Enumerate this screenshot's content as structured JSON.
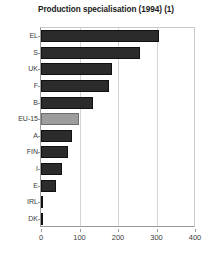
{
  "chart_data": {
    "type": "bar",
    "orientation": "horizontal",
    "title": "Production specialisation (1994) (1)",
    "xlabel": "",
    "ylabel": "",
    "categories": [
      "EL",
      "S",
      "UK",
      "F",
      "B",
      "EU-15",
      "A",
      "FIN",
      "I",
      "E",
      "IRL",
      "DK"
    ],
    "values": [
      307,
      256,
      184,
      177,
      134,
      98,
      80,
      70,
      55,
      39,
      3,
      2
    ],
    "xlim": [
      0,
      400
    ],
    "xticks": [
      0,
      100,
      200,
      300,
      400
    ],
    "xtick_labels": [
      "0",
      "100",
      "200",
      "300",
      "400"
    ],
    "grid": "vertical",
    "legend": "none",
    "highlight_category": "EU-15",
    "colors": {
      "bar": "#2b2b2b",
      "bar_highlight": "#9d9d9d",
      "grid": "#d5d5d5",
      "axis": "#9a9a9a",
      "text": "#3a3a3a",
      "title": "#1a1a1a",
      "background": "#ffffff"
    }
  }
}
